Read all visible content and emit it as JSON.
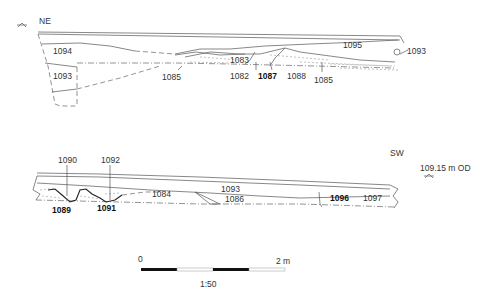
{
  "figure": {
    "type": "archaeological-section-drawing",
    "scale_ratio": "1:50",
    "scale_bar": {
      "start_label": "0",
      "end_label": "2 m",
      "segments": 4,
      "colors": [
        "#111111",
        "#ffffff"
      ]
    },
    "datum": {
      "label": "109.15 m OD"
    }
  },
  "sections": [
    {
      "id": "upper",
      "orientation_label": "NE",
      "contexts": [
        {
          "label": "1094",
          "bold": false
        },
        {
          "label": "1093",
          "bold": false
        },
        {
          "label": "1083",
          "bold": false
        },
        {
          "label": "1095",
          "bold": false
        },
        {
          "label": "1093",
          "bold": false,
          "position": "right-edge"
        },
        {
          "label": "1085",
          "bold": false
        },
        {
          "label": "1082",
          "bold": false
        },
        {
          "label": "1087",
          "bold": true
        },
        {
          "label": "1088",
          "bold": false
        },
        {
          "label": "1085",
          "bold": false,
          "position": "right"
        }
      ]
    },
    {
      "id": "lower",
      "orientation_label": "SW",
      "contexts": [
        {
          "label": "1090",
          "bold": false
        },
        {
          "label": "1092",
          "bold": false
        },
        {
          "label": "1084",
          "bold": false
        },
        {
          "label": "1093",
          "bold": false
        },
        {
          "label": "1086",
          "bold": false
        },
        {
          "label": "1096",
          "bold": true
        },
        {
          "label": "1097",
          "bold": false
        },
        {
          "label": "1089",
          "bold": true
        },
        {
          "label": "1091",
          "bold": true
        }
      ]
    }
  ],
  "colors": {
    "line": "#555555",
    "text": "#333333",
    "feature_cut": "#222222",
    "background": "#ffffff"
  }
}
